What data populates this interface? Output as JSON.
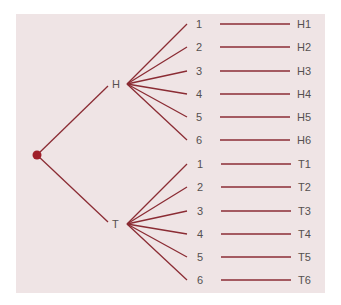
{
  "diagram": {
    "type": "tree",
    "root": {
      "label": ""
    },
    "first_level": [
      {
        "label": "H",
        "children": [
          {
            "label": "1",
            "outcome": "H1"
          },
          {
            "label": "2",
            "outcome": "H2"
          },
          {
            "label": "3",
            "outcome": "H3"
          },
          {
            "label": "4",
            "outcome": "H4"
          },
          {
            "label": "5",
            "outcome": "H5"
          },
          {
            "label": "6",
            "outcome": "H6"
          }
        ]
      },
      {
        "label": "T",
        "children": [
          {
            "label": "1",
            "outcome": "T1"
          },
          {
            "label": "2",
            "outcome": "T2"
          },
          {
            "label": "3",
            "outcome": "T3"
          },
          {
            "label": "4",
            "outcome": "T4"
          },
          {
            "label": "5",
            "outcome": "T5"
          },
          {
            "label": "6",
            "outcome": "T6"
          }
        ]
      }
    ],
    "colors": {
      "background": "#efe4e5",
      "line": "#8b2c34",
      "root_dot": "#a01f2a",
      "text": "#555050"
    }
  }
}
